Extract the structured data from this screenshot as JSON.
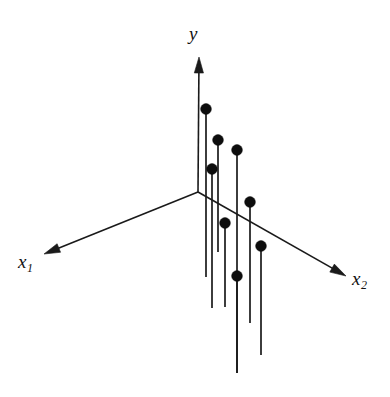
{
  "figure": {
    "title": "",
    "background_color": "#ffffff",
    "width": 390,
    "height": 397,
    "axis_color": "#1a1a1a",
    "dot_color": "#0d0d0d",
    "stem_color": "#1a1a1a",
    "labels": {
      "y": "y",
      "x1_base": "x",
      "x1_sub": "1",
      "x2_base": "x",
      "x2_sub": "2"
    }
  },
  "chart_data": {
    "type": "scatter",
    "title": "",
    "subtitle": "",
    "xlabel": "x₁",
    "ylabel": "y",
    "zlabel": "x₂",
    "projection": "3d-axonometric",
    "grid": false,
    "legend": null,
    "axes": [
      {
        "name": "y",
        "label": "y",
        "direction": "up",
        "origin_px": [
          198,
          192
        ],
        "tip_px": [
          199,
          57
        ],
        "arrow": true
      },
      {
        "name": "x1",
        "label": "x₁",
        "direction": "lower-left",
        "origin_px": [
          198,
          192
        ],
        "tip_px": [
          44,
          254
        ],
        "arrow": true
      },
      {
        "name": "x2",
        "label": "x₂",
        "direction": "lower-right",
        "origin_px": [
          198,
          192
        ],
        "tip_px": [
          346,
          276
        ],
        "arrow": true
      }
    ],
    "points": [
      {
        "id": 1,
        "dot_px": [
          206,
          109
        ],
        "stem_bottom_px": [
          206,
          277
        ],
        "radius_px": 5.4
      },
      {
        "id": 2,
        "dot_px": [
          218,
          140
        ],
        "stem_bottom_px": [
          218,
          252
        ],
        "radius_px": 5.4
      },
      {
        "id": 3,
        "dot_px": [
          237,
          150
        ],
        "stem_bottom_px": [
          237,
          373
        ],
        "radius_px": 5.4
      },
      {
        "id": 4,
        "dot_px": [
          212,
          169
        ],
        "stem_bottom_px": [
          212,
          308
        ],
        "radius_px": 5.4
      },
      {
        "id": 5,
        "dot_px": [
          250,
          202
        ],
        "stem_bottom_px": [
          250,
          323
        ],
        "radius_px": 5.4
      },
      {
        "id": 6,
        "dot_px": [
          225,
          223
        ],
        "stem_bottom_px": [
          225,
          307
        ],
        "radius_px": 5.4
      },
      {
        "id": 7,
        "dot_px": [
          261,
          246
        ],
        "stem_bottom_px": [
          261,
          355
        ],
        "radius_px": 5.4
      },
      {
        "id": 8,
        "dot_px": [
          237,
          276
        ],
        "stem_bottom_px": [
          237,
          373
        ],
        "radius_px": 5.4
      }
    ]
  }
}
